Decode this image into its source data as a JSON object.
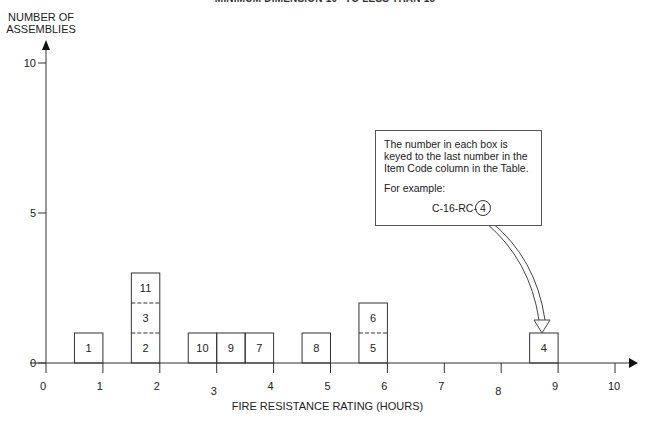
{
  "header": {
    "title": "MINIMUM DIMENSION 10\" TO LESS THAN 15\""
  },
  "axes": {
    "y_label_line1": "NUMBER OF",
    "y_label_line2": "ASSEMBLIES",
    "x_label": "FIRE RESISTANCE RATING (HOURS)"
  },
  "note": {
    "text": "The number in each box is keyed to the last number in the Item Code column in the Table.",
    "example_label": "For example:",
    "example_code_prefix": "C-16-RC-",
    "example_code_suffix": "4"
  },
  "chart_data": {
    "type": "bar",
    "title": "MINIMUM DIMENSION 10\" TO LESS THAN 15\"",
    "xlabel": "FIRE RESISTANCE RATING (HOURS)",
    "ylabel": "NUMBER OF ASSEMBLIES",
    "xlim": [
      0,
      10
    ],
    "ylim": [
      0,
      10
    ],
    "x_ticks": [
      0,
      1,
      2,
      3,
      4,
      5,
      6,
      7,
      8,
      9,
      10
    ],
    "y_ticks": [
      0,
      5,
      10
    ],
    "grid": false,
    "bin_width_hours": 0.5,
    "stacked_boxes": [
      {
        "x_start": 0.5,
        "x_end": 1.0,
        "items": [
          "1"
        ]
      },
      {
        "x_start": 1.5,
        "x_end": 2.0,
        "items": [
          "2",
          "3",
          "11"
        ]
      },
      {
        "x_start": 2.5,
        "x_end": 3.0,
        "items": [
          "10"
        ]
      },
      {
        "x_start": 3.0,
        "x_end": 3.5,
        "items": [
          "9"
        ]
      },
      {
        "x_start": 3.5,
        "x_end": 4.0,
        "items": [
          "7"
        ]
      },
      {
        "x_start": 4.5,
        "x_end": 5.0,
        "items": [
          "8"
        ]
      },
      {
        "x_start": 5.5,
        "x_end": 6.0,
        "items": [
          "5",
          "6"
        ]
      },
      {
        "x_start": 8.5,
        "x_end": 9.0,
        "items": [
          "4"
        ]
      }
    ],
    "categories": [
      "0.5-1.0",
      "1.5-2.0",
      "2.5-3.0",
      "3.0-3.5",
      "3.5-4.0",
      "4.5-5.0",
      "5.5-6.0",
      "8.5-9.0"
    ],
    "values": [
      1,
      3,
      1,
      1,
      1,
      1,
      2,
      1
    ],
    "annotation": "The number in each box is keyed to the last number in the Item Code column in the Table. For example: C-16-RC-4"
  }
}
